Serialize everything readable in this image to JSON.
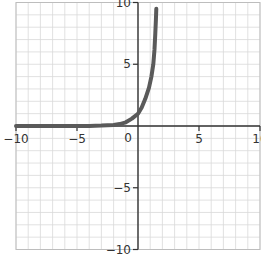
{
  "chart_data": {
    "type": "line",
    "title": "",
    "xlabel": "",
    "ylabel": "",
    "xlim": [
      -10,
      10
    ],
    "ylim": [
      -10,
      10
    ],
    "grid": true,
    "grid_step": 1,
    "legend": null,
    "x_ticks": [
      -10,
      -5,
      0,
      5,
      10
    ],
    "x_tick_labels": [
      "−10",
      "−5",
      "0",
      "5",
      "10"
    ],
    "y_ticks": [
      -10,
      -5,
      5,
      10
    ],
    "y_tick_labels": [
      "−10",
      "−5",
      "5",
      "10"
    ],
    "origin_label": "0",
    "series": [
      {
        "name": "curve",
        "color": "#5a5a5a",
        "x": [
          -10,
          -8,
          -6,
          -4,
          -3,
          -2,
          -1.5,
          -1,
          -0.5,
          0,
          0.3,
          0.6,
          0.9,
          1.1,
          1.25,
          1.35,
          1.42,
          1.47,
          1.5
        ],
        "y": [
          0,
          0,
          0,
          0.01,
          0.03,
          0.08,
          0.15,
          0.3,
          0.6,
          1.0,
          1.5,
          2.2,
          3.1,
          4.0,
          5.0,
          6.2,
          7.5,
          8.6,
          9.5
        ]
      }
    ],
    "colors": {
      "axis": "#333333",
      "grid": "#d9d9d9",
      "curve": "#5a5a5a"
    }
  }
}
